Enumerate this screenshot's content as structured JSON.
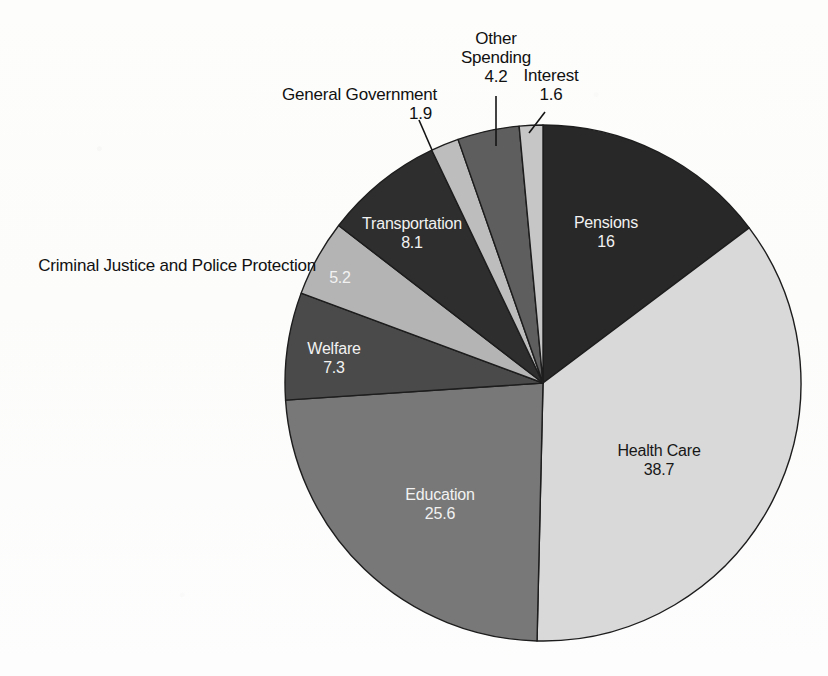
{
  "figure": {
    "title_clipped": "State and Local Government Expenditures (percent of total)",
    "background_color": "#fdfdfd"
  },
  "chart_data": {
    "type": "pie",
    "title": "",
    "xlabel": "",
    "ylabel": "",
    "units": "percent",
    "total": 108.6,
    "start_angle_deg": 0,
    "direction": "clockwise",
    "legend_position": "none",
    "grid": false,
    "categories": [
      "Pensions",
      "Health Care",
      "Education",
      "Welfare",
      "Criminal Justice and Police Protection",
      "Transportation",
      "General Government",
      "Other Spending",
      "Interest"
    ],
    "values": [
      16,
      38.7,
      25.6,
      7.3,
      5.2,
      8.1,
      1.9,
      4.2,
      1.6
    ],
    "value_labels": [
      "16",
      "38.7",
      "25.6",
      "7.3",
      "5.2",
      "8.1",
      "1.9",
      "4.2",
      "1.6"
    ],
    "colors": [
      "#282828",
      "#d9d9d9",
      "#787878",
      "#4a4a4a",
      "#b4b4b4",
      "#2e2e2e",
      "#bdbdbd",
      "#5e5e5e",
      "#c6c6c6"
    ],
    "slices": [
      {
        "name": "Pensions",
        "value": 16,
        "value_label": "16",
        "color": "#282828",
        "label_placement": "inside",
        "label_ink": "light"
      },
      {
        "name": "Health Care",
        "value": 38.7,
        "value_label": "38.7",
        "color": "#d9d9d9",
        "label_placement": "inside",
        "label_ink": "dark"
      },
      {
        "name": "Education",
        "value": 25.6,
        "value_label": "25.6",
        "color": "#787878",
        "label_placement": "inside",
        "label_ink": "light"
      },
      {
        "name": "Welfare",
        "value": 7.3,
        "value_label": "7.3",
        "color": "#4a4a4a",
        "label_placement": "inside",
        "label_ink": "light"
      },
      {
        "name": "Criminal Justice and Police Protection",
        "value": 5.2,
        "value_label": "5.2",
        "color": "#b4b4b4",
        "label_placement": "split",
        "label_ink": "light"
      },
      {
        "name": "Transportation",
        "value": 8.1,
        "value_label": "8.1",
        "color": "#2e2e2e",
        "label_placement": "inside",
        "label_ink": "light"
      },
      {
        "name": "General Government",
        "value": 1.9,
        "value_label": "1.9",
        "color": "#bdbdbd",
        "label_placement": "outside",
        "label_ink": "dark"
      },
      {
        "name": "Other Spending",
        "value": 4.2,
        "value_label": "4.2",
        "color": "#5e5e5e",
        "label_placement": "outside",
        "label_ink": "dark"
      },
      {
        "name": "Interest",
        "value": 1.6,
        "value_label": "1.6",
        "color": "#c6c6c6",
        "label_placement": "outside",
        "label_ink": "dark"
      }
    ]
  },
  "callouts": {
    "general_government": {
      "name": "General Government",
      "value": "1.9"
    },
    "other_spending_line1": "Other",
    "other_spending_line2": "Spending",
    "other_spending_value": "4.2",
    "interest": {
      "name": "Interest",
      "value": "1.6"
    },
    "criminal_justice": {
      "name": "Criminal Justice and Police Protection",
      "value": "5.2"
    }
  }
}
